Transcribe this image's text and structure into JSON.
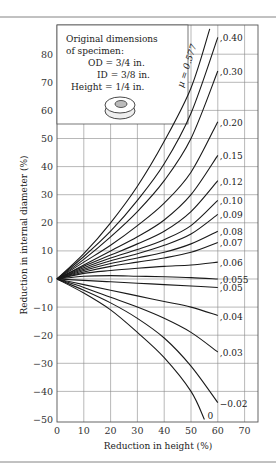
{
  "chart_data": {
    "type": "line",
    "title": "",
    "xlabel": "Reduction in height (%)",
    "ylabel": "Reduction in internal diameter (%)",
    "xlim": [
      0,
      75
    ],
    "ylim": [
      -50,
      90
    ],
    "xticks": [
      "0",
      "10",
      "20",
      "30",
      "40",
      "50",
      "60",
      "70"
    ],
    "yticks": [
      "-50",
      "-40",
      "-30",
      "-20",
      "-10",
      "0",
      "10",
      "20",
      "30",
      "40",
      "50",
      "60",
      "70",
      "80"
    ],
    "grid": true,
    "inset": {
      "lines": [
        "Original dimensions",
        "of specimen:",
        "OD = 3/4 in.",
        "ID = 3/8 in.",
        "Height = 1/4 in."
      ],
      "icon": "ring-specimen-icon"
    },
    "series": [
      {
        "name": "μ = 0.577",
        "x": [
          0,
          10,
          20,
          30,
          40,
          50,
          57
        ],
        "y": [
          0,
          9,
          20,
          33,
          49,
          68,
          89
        ]
      },
      {
        "name": "0.40",
        "x": [
          0,
          10,
          20,
          30,
          40,
          50,
          60
        ],
        "y": [
          0,
          8,
          17,
          28,
          41,
          59,
          86
        ]
      },
      {
        "name": "0.30",
        "x": [
          0,
          10,
          20,
          30,
          40,
          50,
          60
        ],
        "y": [
          0,
          7,
          15,
          24,
          35,
          50,
          74
        ]
      },
      {
        "name": "0.20",
        "x": [
          0,
          10,
          20,
          30,
          40,
          50,
          60
        ],
        "y": [
          0,
          6,
          12,
          19,
          27,
          38,
          56
        ]
      },
      {
        "name": "0.15",
        "x": [
          0,
          10,
          20,
          30,
          40,
          50,
          60
        ],
        "y": [
          0,
          5,
          10,
          15,
          21,
          30,
          44
        ]
      },
      {
        "name": "0.12",
        "x": [
          0,
          10,
          20,
          30,
          40,
          50,
          60
        ],
        "y": [
          0,
          4.5,
          8.5,
          12.5,
          17,
          24,
          35
        ]
      },
      {
        "name": "0.10",
        "x": [
          0,
          10,
          20,
          30,
          40,
          50,
          60
        ],
        "y": [
          0,
          4,
          7.5,
          10.5,
          14,
          19,
          28
        ]
      },
      {
        "name": "0.09",
        "x": [
          0,
          10,
          20,
          30,
          40,
          50,
          60
        ],
        "y": [
          0,
          3.5,
          6.5,
          9,
          12,
          16,
          23
        ]
      },
      {
        "name": "0.08",
        "x": [
          0,
          10,
          20,
          30,
          40,
          50,
          60
        ],
        "y": [
          0,
          3,
          5.5,
          7.5,
          9.5,
          12.5,
          17
        ]
      },
      {
        "name": "0.07",
        "x": [
          0,
          10,
          20,
          30,
          40,
          50,
          60
        ],
        "y": [
          0,
          2.5,
          4.5,
          6,
          7.5,
          9.5,
          13
        ]
      },
      {
        "name": "0.06",
        "x": [
          0,
          10,
          20,
          30,
          40,
          50,
          60
        ],
        "y": [
          0,
          2,
          3,
          3.8,
          4.5,
          5,
          6
        ]
      },
      {
        "name": "0.055",
        "x": [
          0,
          10,
          20,
          30,
          40,
          50,
          60
        ],
        "y": [
          0,
          1,
          1.2,
          1,
          0.8,
          0.5,
          0
        ]
      },
      {
        "name": "0.05",
        "x": [
          0,
          10,
          20,
          30,
          40,
          50,
          60
        ],
        "y": [
          0,
          -0.5,
          -1,
          -1.5,
          -2,
          -2.5,
          -3
        ]
      },
      {
        "name": "0.04",
        "x": [
          0,
          10,
          20,
          30,
          40,
          50,
          60
        ],
        "y": [
          0,
          -2,
          -4,
          -6,
          -8,
          -10,
          -13
        ]
      },
      {
        "name": "0.03",
        "x": [
          0,
          10,
          20,
          30,
          40,
          50,
          60
        ],
        "y": [
          0,
          -3,
          -6.5,
          -10,
          -14,
          -19,
          -26
        ]
      },
      {
        "name": "0.02",
        "x": [
          0,
          10,
          20,
          30,
          40,
          50,
          60
        ],
        "y": [
          0,
          -4,
          -8.5,
          -14,
          -21,
          -31,
          -44
        ]
      },
      {
        "name": "0",
        "x": [
          0,
          10,
          20,
          30,
          40,
          50,
          55
        ],
        "y": [
          0,
          -5,
          -11,
          -19,
          -28,
          -40,
          -50
        ]
      }
    ]
  }
}
